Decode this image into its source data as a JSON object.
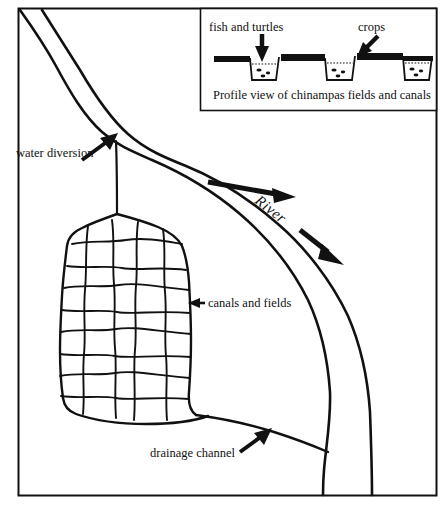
{
  "diagram": {
    "map_labels": {
      "water_diversion": "water diversion",
      "canals_and_fields": "canals and fields",
      "drainage_channel": "drainage channel",
      "river": "River"
    },
    "inset": {
      "caption": "Profile view of chinampas fields and canals",
      "labels": {
        "fish_and_turtles": "fish and turtles",
        "crops": "crops"
      },
      "canal_count": 3
    },
    "grid": {
      "columns": 5,
      "rows": 9
    },
    "colors": {
      "ink": "#111111",
      "background": "#ffffff"
    }
  }
}
